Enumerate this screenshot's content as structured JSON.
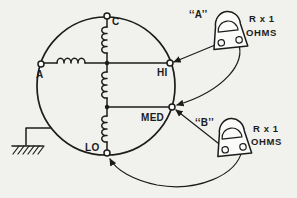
{
  "diagram": {
    "terminals": {
      "c": "C",
      "a": "A",
      "hi": "HI",
      "med": "MED",
      "lo": "LO"
    },
    "meter_a": {
      "name": "‘‘A’’",
      "range": "R x 1",
      "unit": "OHMS"
    },
    "meter_b": {
      "name": "‘‘B’’",
      "range": "R x 1",
      "unit": "OHMS"
    },
    "connections": {
      "meter_a_leads": [
        "HI",
        "MED"
      ],
      "meter_b_leads": [
        "MED",
        "LO"
      ]
    },
    "colors": {
      "ink": "#1c1c1c",
      "paper": "#f1f1ed"
    }
  }
}
